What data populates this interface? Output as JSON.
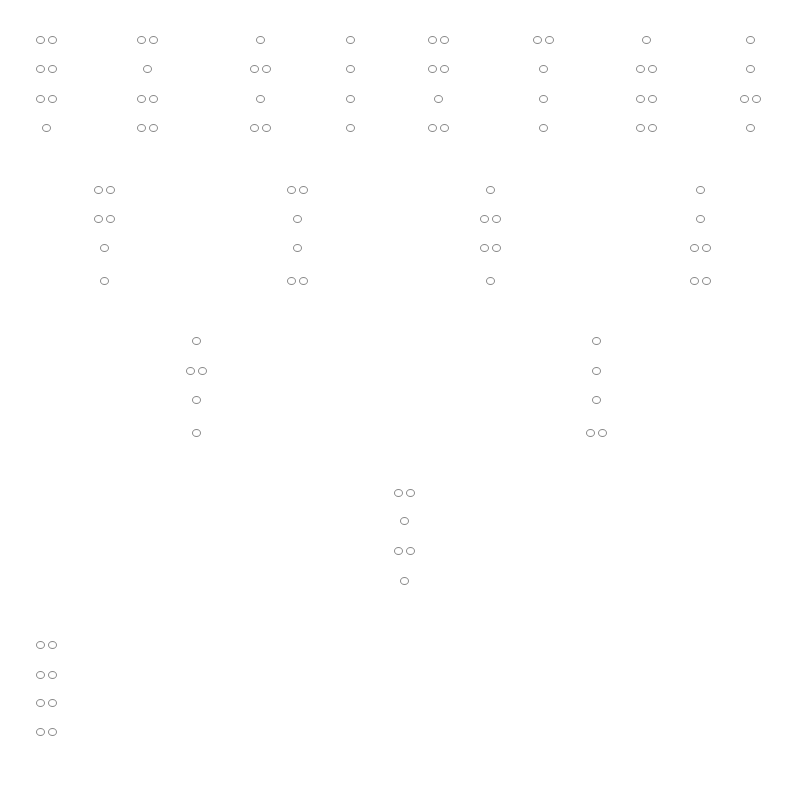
{
  "diagram": {
    "type": "geomancy-shield-chart",
    "dot_color": "#8a8a8a",
    "background": "#ffffff",
    "legend": "1 = single dot, 2 = double dot; lines listed top to bottom",
    "rows": [
      {
        "name": "row-1",
        "line_y": [
          40,
          69,
          99,
          128
        ],
        "figures": [
          {
            "x": 46,
            "lines": [
              2,
              2,
              2,
              1
            ]
          },
          {
            "x": 147,
            "lines": [
              2,
              1,
              2,
              2
            ]
          },
          {
            "x": 260,
            "lines": [
              1,
              2,
              1,
              2
            ]
          },
          {
            "x": 350,
            "lines": [
              1,
              1,
              1,
              1
            ]
          },
          {
            "x": 438,
            "lines": [
              2,
              2,
              1,
              2
            ]
          },
          {
            "x": 543,
            "lines": [
              2,
              1,
              1,
              1
            ]
          },
          {
            "x": 646,
            "lines": [
              1,
              2,
              2,
              2
            ]
          },
          {
            "x": 750,
            "lines": [
              1,
              1,
              2,
              1
            ]
          }
        ]
      },
      {
        "name": "row-2",
        "line_y": [
          190,
          219,
          248,
          281
        ],
        "figures": [
          {
            "x": 104,
            "lines": [
              2,
              2,
              1,
              1
            ]
          },
          {
            "x": 297,
            "lines": [
              2,
              1,
              1,
              2
            ]
          },
          {
            "x": 490,
            "lines": [
              1,
              2,
              2,
              1
            ]
          },
          {
            "x": 700,
            "lines": [
              1,
              1,
              2,
              2
            ]
          }
        ]
      },
      {
        "name": "row-3",
        "line_y": [
          341,
          371,
          400,
          433
        ],
        "figures": [
          {
            "x": 196,
            "lines": [
              1,
              2,
              1,
              1
            ]
          },
          {
            "x": 596,
            "lines": [
              1,
              1,
              1,
              2
            ]
          }
        ]
      },
      {
        "name": "row-4",
        "line_y": [
          493,
          521,
          551,
          581
        ],
        "figures": [
          {
            "x": 404,
            "lines": [
              2,
              1,
              2,
              1
            ]
          }
        ]
      },
      {
        "name": "row-5",
        "line_y": [
          645,
          675,
          703,
          732
        ],
        "figures": [
          {
            "x": 46,
            "lines": [
              2,
              2,
              2,
              2
            ]
          }
        ]
      }
    ]
  }
}
